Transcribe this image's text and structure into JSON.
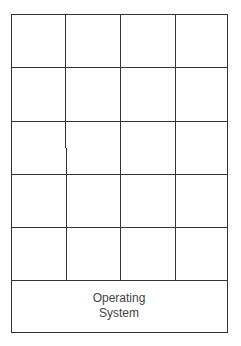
{
  "diagram": {
    "type": "memory-layout",
    "grid": {
      "rows": 5,
      "columns": 4,
      "cells_empty": true
    },
    "bottom_block": {
      "label_lines": [
        "Operating",
        "System"
      ]
    },
    "colors": {
      "line": "#333333",
      "text": "#444444",
      "background": "#ffffff"
    }
  }
}
